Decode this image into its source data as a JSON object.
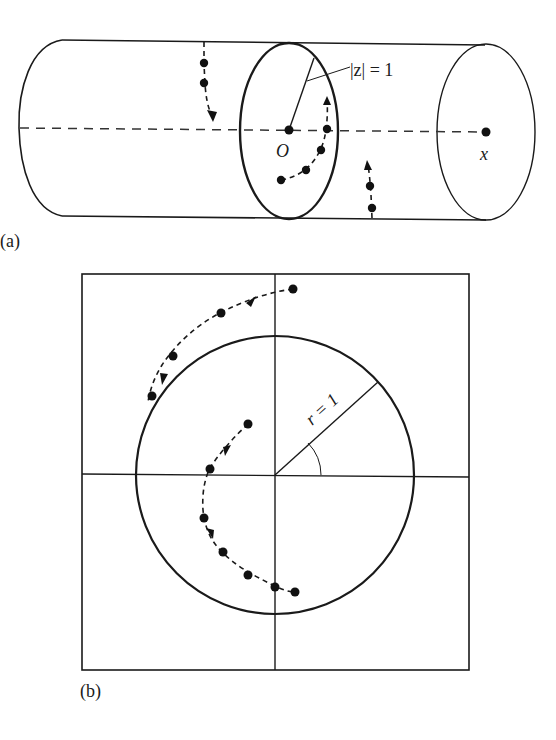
{
  "figure": {
    "panel_a": {
      "label": "(a)",
      "radius_label": "|z| = 1",
      "origin_label": "O",
      "x_label": "x",
      "description": "Cylinder with unit circle cross-section |z|=1 at origin O; dashed x axis; trajectories of points shown with dots and arrows"
    },
    "panel_b": {
      "label": "(b)",
      "radius_label": "r = 1",
      "description": "Cross-section square with unit circle r=1, horizontal and vertical axes, radius line with angle arc; dotted trajectories with arrows"
    }
  },
  "colors": {
    "ink": "#1a1a1a",
    "background": "#ffffff"
  }
}
